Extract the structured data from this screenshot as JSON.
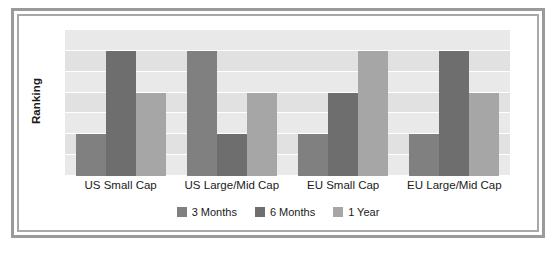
{
  "chart_data": {
    "type": "bar",
    "title": "",
    "subtitle": "",
    "xlabel": "",
    "ylabel": "Ranking",
    "categories": [
      "US Small Cap",
      "US Large/Mid Cap",
      "EU Small Cap",
      "EU Large/Mid Cap"
    ],
    "series": [
      {
        "name": "3 Months",
        "color": "#808080",
        "values": [
          2,
          6,
          2,
          2
        ]
      },
      {
        "name": "6 Months",
        "color": "#6e6e6e",
        "values": [
          6,
          2,
          4,
          6
        ]
      },
      {
        "name": "1 Year",
        "color": "#a6a6a6",
        "values": [
          4,
          4,
          6,
          4
        ]
      }
    ],
    "ylim": [
      0,
      7
    ],
    "y_ticks_visible": false,
    "grid": true,
    "grid_bands": 7,
    "legend_position": "bottom",
    "annotations": []
  },
  "axes": {
    "y_title": "Ranking",
    "x_tick_labels": [
      "US Small Cap",
      "US Large/Mid Cap",
      "EU Small Cap",
      "EU Large/Mid Cap"
    ]
  },
  "legend": {
    "items": [
      {
        "label": "3 Months",
        "color": "#808080"
      },
      {
        "label": "6 Months",
        "color": "#6e6e6e"
      },
      {
        "label": "1 Year",
        "color": "#a6a6a6"
      }
    ]
  },
  "style": {
    "frame_outer_color": "#9a9a9a",
    "frame_inner_color": "#a8a8a8",
    "plot_background": "#e6e6e6",
    "gridline_color": "#ffffff",
    "text_color": "#1a1a1a",
    "page_background": "#ffffff"
  }
}
